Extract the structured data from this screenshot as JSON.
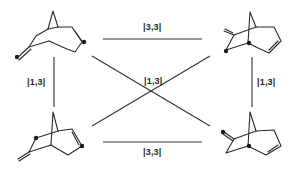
{
  "diagram": {
    "title": "",
    "labels": {
      "top": "|3,3|",
      "bottom": "|3,3|",
      "left": "|1,3|",
      "right": "|1,3|",
      "center": "|1,3|"
    },
    "nodes": [
      {
        "id": "top-left",
        "description": "bicyclic diene with exocyclic methylene, labeled carbons (dots) at methylene terminus and ring alkene"
      },
      {
        "id": "top-right",
        "description": "bicyclic ketone-like exocyclic methylene isomer with labeled bridgehead and ring carbon"
      },
      {
        "id": "bottom-left",
        "description": "bicyclic exocyclic methylene isomer with labeled ring carbons"
      },
      {
        "id": "bottom-right",
        "description": "bicyclic isomer with labeled methylene terminus and bridgehead"
      }
    ],
    "edges": [
      {
        "from": "top-left",
        "to": "top-right",
        "label": "|3,3|"
      },
      {
        "from": "bottom-left",
        "to": "bottom-right",
        "label": "|3,3|"
      },
      {
        "from": "top-left",
        "to": "bottom-left",
        "label": "|1,3|"
      },
      {
        "from": "top-right",
        "to": "bottom-right",
        "label": "|1,3|"
      },
      {
        "from": "top-left",
        "to": "bottom-right",
        "label": "|1,3|"
      },
      {
        "from": "bottom-left",
        "to": "top-right",
        "label": "|1,3|"
      }
    ],
    "colors": {
      "line": "#333333",
      "atom_marker": "#1a1a1a",
      "background": "#ffffff"
    }
  }
}
